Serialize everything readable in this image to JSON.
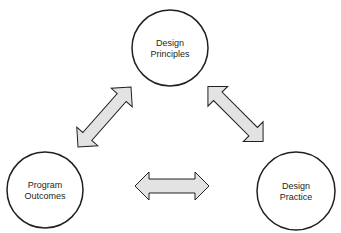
{
  "diagram": {
    "nodes": [
      {
        "id": "design-principles",
        "line1": "Design",
        "line2": "Principles"
      },
      {
        "id": "program-outcomes",
        "line1": "Program",
        "line2": "Outcomes"
      },
      {
        "id": "design-practice",
        "line1": "Design",
        "line2": "Practice"
      }
    ],
    "edges": [
      {
        "from": "design-principles",
        "to": "program-outcomes",
        "type": "bidirectional"
      },
      {
        "from": "design-principles",
        "to": "design-practice",
        "type": "bidirectional"
      },
      {
        "from": "program-outcomes",
        "to": "design-practice",
        "type": "bidirectional"
      }
    ],
    "colors": {
      "stroke": "#231f20",
      "arrow_fill": "#e3e3e3",
      "background": "#ffffff"
    }
  }
}
